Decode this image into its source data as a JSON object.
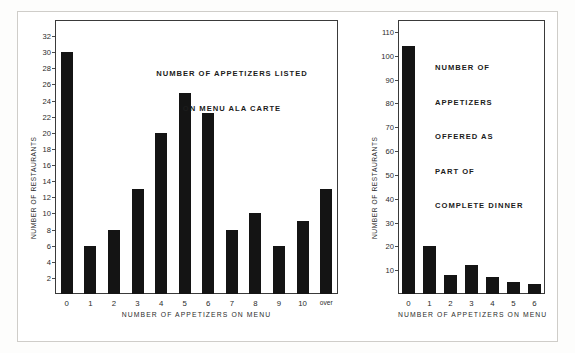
{
  "figure": {
    "background_color": "#ffffff",
    "bar_color": "#141414",
    "axis_color": "#3a3a3a"
  },
  "chart_data": [
    {
      "id": "ala-carte",
      "type": "bar",
      "title": "NUMBER OF APPETIZERS LISTED\nON MENU ALA CARTE",
      "title_line1": "NUMBER OF APPETIZERS LISTED",
      "title_line2": "ON MENU ALA CARTE",
      "xlabel": "NUMBER OF APPETIZERS ON MENU",
      "ylabel": "NUMBER OF RESTAURANTS",
      "categories": [
        "0",
        "1",
        "2",
        "3",
        "4",
        "5",
        "6",
        "7",
        "8",
        "9",
        "10",
        "over"
      ],
      "values": [
        30,
        6,
        8,
        13,
        20,
        25,
        22.5,
        8,
        10,
        6,
        9,
        13
      ],
      "yticks": [
        2,
        4,
        6,
        8,
        10,
        12,
        14,
        16,
        18,
        20,
        22,
        24,
        26,
        28,
        30,
        32
      ],
      "ylim": [
        0,
        34
      ],
      "grid": false,
      "legend": "none"
    },
    {
      "id": "complete-dinner",
      "type": "bar",
      "title": "NUMBER OF\nAPPETIZERS\nOFFERED AS\nPART OF\nCOMPLETE DINNER",
      "title_line1": "NUMBER OF",
      "title_line2": "APPETIZERS",
      "title_line3": "OFFERED AS",
      "title_line4": "PART OF",
      "title_line5": "COMPLETE DINNER",
      "xlabel": "NUMBER OF APPETIZERS ON MENU",
      "ylabel": "NUMBER OF RESTAURANTS",
      "categories": [
        "0",
        "1",
        "2",
        "3",
        "4",
        "5",
        "6"
      ],
      "values": [
        104,
        20,
        8,
        12,
        7,
        5,
        4
      ],
      "yticks": [
        10,
        20,
        30,
        40,
        50,
        60,
        70,
        80,
        90,
        100,
        110
      ],
      "ylim": [
        0,
        115
      ],
      "grid": false,
      "legend": "none"
    }
  ]
}
